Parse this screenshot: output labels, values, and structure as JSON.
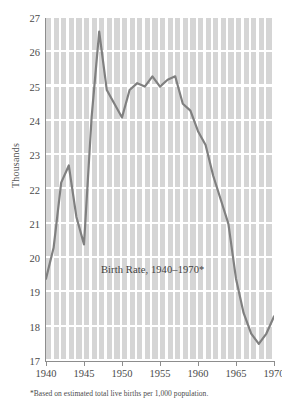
{
  "chart_data": {
    "type": "line",
    "title": "Birth Rate, 1940–1970*",
    "xlabel": "",
    "ylabel": "Thousands",
    "footnote": "*Based on estimated total live births per 1,000 population.",
    "xlim": [
      1940,
      1970
    ],
    "ylim": [
      17,
      27
    ],
    "xticks": [
      1940,
      1945,
      1950,
      1955,
      1960,
      1965,
      1970
    ],
    "xticklabels": [
      "1940",
      "1945",
      "1950",
      "1955",
      "1960",
      "1965",
      "1970"
    ],
    "yticks": [
      17,
      18,
      19,
      20,
      21,
      22,
      23,
      24,
      25,
      26,
      27
    ],
    "yticklabels": [
      "17",
      "18",
      "19",
      "20",
      "21",
      "22",
      "23",
      "24",
      "25",
      "26",
      "27"
    ],
    "grid": true,
    "grid_style": "striped-vertical-bands",
    "legend": false,
    "line_color": "#808080",
    "plot_bg_color": "#d5d5d5",
    "grid_line_color": "#ffffff",
    "axis_color": "#8d8d8d",
    "x": [
      1940,
      1941,
      1942,
      1943,
      1944,
      1945,
      1946,
      1947,
      1948,
      1949,
      1950,
      1951,
      1952,
      1953,
      1954,
      1955,
      1956,
      1957,
      1958,
      1959,
      1960,
      1961,
      1962,
      1963,
      1964,
      1965,
      1966,
      1967,
      1968,
      1969,
      1970
    ],
    "values": [
      19.4,
      20.3,
      22.2,
      22.7,
      21.2,
      20.4,
      24.1,
      26.6,
      24.9,
      24.5,
      24.1,
      24.9,
      25.1,
      25.0,
      25.3,
      25.0,
      25.2,
      25.3,
      24.5,
      24.3,
      23.7,
      23.3,
      22.4,
      21.7,
      21.0,
      19.4,
      18.4,
      17.8,
      17.5,
      17.8,
      18.3
    ],
    "annotations": [
      {
        "text": "Birth Rate, 1940–1970*",
        "x": 1950.0,
        "y": 19.75
      }
    ],
    "series": [
      {
        "name": "Birth Rate",
        "values": [
          19.4,
          20.3,
          22.2,
          22.7,
          21.2,
          20.4,
          24.1,
          26.6,
          24.9,
          24.5,
          24.1,
          24.9,
          25.1,
          25.0,
          25.3,
          25.0,
          25.2,
          25.3,
          24.5,
          24.3,
          23.7,
          23.3,
          22.4,
          21.7,
          21.0,
          19.4,
          18.4,
          17.8,
          17.5,
          17.8,
          18.3
        ]
      }
    ]
  }
}
